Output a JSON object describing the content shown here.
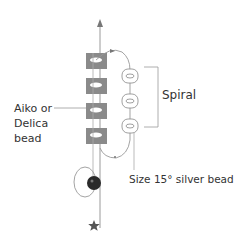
{
  "diagram": {
    "labels": {
      "spiral": "Spiral",
      "core_bead_line1": "Aiko or",
      "core_bead_line2": "Delica",
      "core_bead_line3": "bead",
      "silver_bead": "Size 15° silver bead"
    },
    "core_beads": {
      "count": 4,
      "color": "#8a8a8a"
    },
    "spiral_beads": {
      "count": 3,
      "color": "#ffffff"
    },
    "anchor_bead": {
      "color": "#2a2a2a"
    },
    "thread_color": "#999999",
    "start_marker_icon": "star-icon",
    "direction_icon": "arrow-up-icon"
  }
}
